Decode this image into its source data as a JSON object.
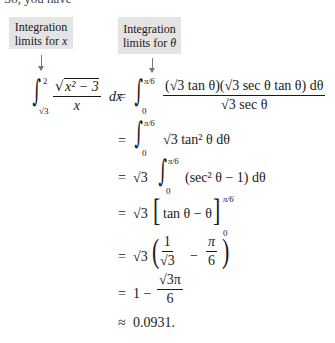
{
  "intro": "So, you have",
  "labels": {
    "x_limits": [
      "Integration",
      "limits for "
    ],
    "x_var": "x",
    "theta_limits": [
      "Integration",
      "limits for "
    ],
    "theta_var": "θ"
  },
  "equation": {
    "lhs": {
      "upper": "2",
      "lower": "√3",
      "numerator_radicand": "x² − 3",
      "denominator": "x",
      "differential": "dx"
    },
    "lines": [
      {
        "op": "=",
        "upper": "π/6",
        "lower": "0",
        "numerator": "(√3 tan θ)(√3 sec θ tan θ) dθ",
        "denominator": "√3 sec θ"
      },
      {
        "op": "=",
        "upper": "π/6",
        "lower": "0",
        "expr": "√3 tan² θ dθ"
      },
      {
        "op": "=",
        "prefix": "√3",
        "upper": "π/6",
        "lower": "0",
        "expr": "(sec² θ − 1) dθ"
      },
      {
        "op": "=",
        "prefix": "√3",
        "bracket": "tan θ − θ",
        "upper": "π/6",
        "lower": "0"
      },
      {
        "op": "=",
        "prefix": "√3",
        "frac1_num": "1",
        "frac1_den": "√3",
        "minus": "−",
        "frac2_num": "π",
        "frac2_den": "6"
      },
      {
        "op": "=",
        "lead": "1 −",
        "frac_num": "√3π",
        "frac_den": "6"
      },
      {
        "op": "≈",
        "value": "0.0931."
      }
    ]
  }
}
